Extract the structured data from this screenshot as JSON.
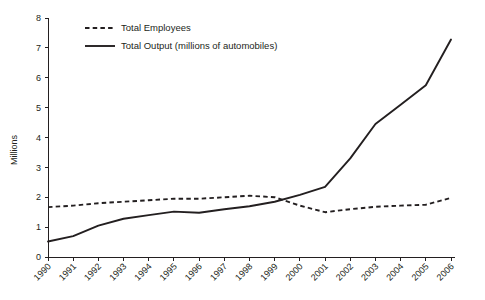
{
  "chart_data": {
    "type": "line",
    "title": "",
    "xlabel": "",
    "ylabel": "Millions",
    "x": [
      1990,
      1991,
      1992,
      1993,
      1994,
      1995,
      1996,
      1997,
      1998,
      1999,
      2000,
      2001,
      2002,
      2003,
      2004,
      2005,
      2006
    ],
    "xtick_labels": [
      "1990",
      "1991",
      "1992",
      "1993",
      "1994",
      "1995",
      "1996",
      "1997",
      "1998",
      "1999",
      "2000",
      "2001",
      "2002",
      "2003",
      "2004",
      "2005",
      "2006"
    ],
    "ytick_labels": [
      "0",
      "1",
      "2",
      "3",
      "4",
      "5",
      "6",
      "7",
      "8"
    ],
    "yticks": [
      0,
      1,
      2,
      3,
      4,
      5,
      6,
      7,
      8
    ],
    "ylim": [
      0,
      8
    ],
    "xlim": [
      1990,
      2006
    ],
    "grid": false,
    "legend_position": "top-left",
    "series": [
      {
        "name": "Total Employees",
        "style": "dashed",
        "color": "#231f20",
        "values": [
          1.67,
          1.72,
          1.8,
          1.85,
          1.9,
          1.95,
          1.95,
          2.0,
          2.05,
          2.0,
          1.72,
          1.5,
          1.6,
          1.68,
          1.72,
          1.75,
          1.98
        ]
      },
      {
        "name": "Total Output (millions of automobiles)",
        "style": "solid",
        "color": "#231f20",
        "values": [
          0.52,
          0.7,
          1.05,
          1.28,
          1.4,
          1.52,
          1.48,
          1.6,
          1.7,
          1.85,
          2.08,
          2.35,
          3.3,
          4.45,
          5.1,
          5.75,
          7.28
        ]
      }
    ]
  },
  "legend": {
    "items": [
      {
        "label": "Total Employees",
        "style": "dashed"
      },
      {
        "label": "Total Output (millions of automobiles)",
        "style": "solid"
      }
    ]
  },
  "axis": {
    "y_title": "Millions"
  }
}
